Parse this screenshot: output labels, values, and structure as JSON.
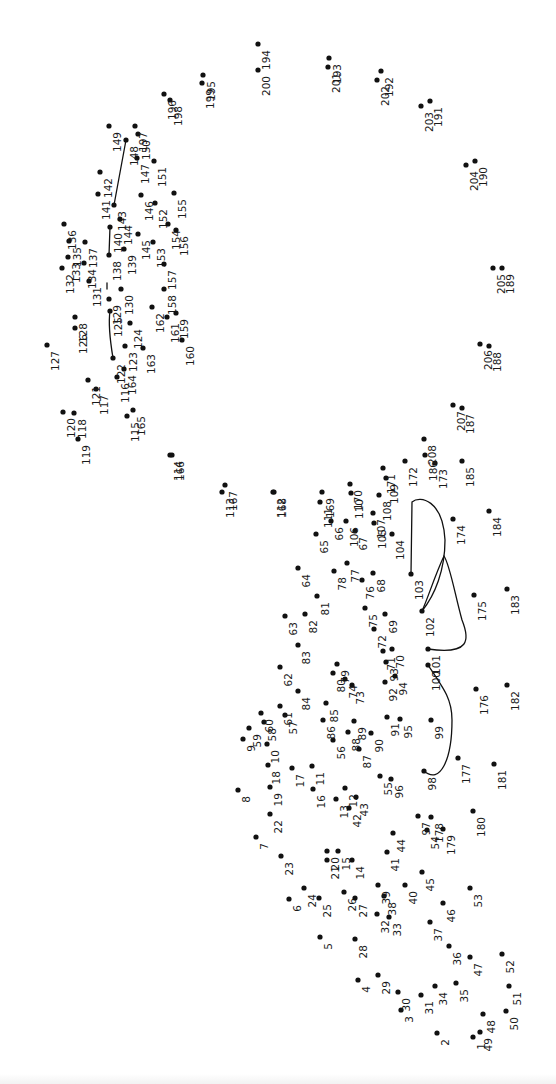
{
  "puzzle": {
    "title": "Connect the dots",
    "orientation": "rotated 90 degrees clockwise",
    "dot_count": 208,
    "ink_color": "#111111",
    "background_color": "#ffffff",
    "pre_drawn_connections": [
      [
        101,
        102
      ],
      [
        102,
        103
      ],
      [
        98,
        100
      ],
      [
        138,
        140
      ],
      [
        143,
        148
      ],
      [
        122,
        125
      ],
      [
        129,
        131
      ]
    ],
    "dots": [
      {
        "n": 1,
        "x": 473,
        "y": 1037
      },
      {
        "n": 2,
        "x": 437,
        "y": 1033
      },
      {
        "n": 3,
        "x": 401,
        "y": 1010
      },
      {
        "n": 4,
        "x": 358,
        "y": 980
      },
      {
        "n": 5,
        "x": 320,
        "y": 937
      },
      {
        "n": 6,
        "x": 289,
        "y": 899
      },
      {
        "n": 7,
        "x": 256,
        "y": 837
      },
      {
        "n": 8,
        "x": 238,
        "y": 790
      },
      {
        "n": 9,
        "x": 243,
        "y": 739
      },
      {
        "n": 10,
        "x": 267,
        "y": 744
      },
      {
        "n": 11,
        "x": 312,
        "y": 766
      },
      {
        "n": 12,
        "x": 345,
        "y": 788
      },
      {
        "n": 13,
        "x": 336,
        "y": 799
      },
      {
        "n": 14,
        "x": 352,
        "y": 860
      },
      {
        "n": 15,
        "x": 338,
        "y": 851
      },
      {
        "n": 16,
        "x": 313,
        "y": 789
      },
      {
        "n": 17,
        "x": 292,
        "y": 768
      },
      {
        "n": 18,
        "x": 268,
        "y": 765
      },
      {
        "n": 19,
        "x": 270,
        "y": 787
      },
      {
        "n": 20,
        "x": 327,
        "y": 851
      },
      {
        "n": 21,
        "x": 327,
        "y": 860
      },
      {
        "n": 22,
        "x": 270,
        "y": 814
      },
      {
        "n": 23,
        "x": 281,
        "y": 856
      },
      {
        "n": 24,
        "x": 304,
        "y": 888
      },
      {
        "n": 25,
        "x": 319,
        "y": 898
      },
      {
        "n": 26,
        "x": 344,
        "y": 892
      },
      {
        "n": 27,
        "x": 355,
        "y": 898
      },
      {
        "n": 28,
        "x": 355,
        "y": 939
      },
      {
        "n": 29,
        "x": 378,
        "y": 975
      },
      {
        "n": 30,
        "x": 398,
        "y": 992
      },
      {
        "n": 31,
        "x": 421,
        "y": 995
      },
      {
        "n": 32,
        "x": 377,
        "y": 914
      },
      {
        "n": 33,
        "x": 389,
        "y": 917
      },
      {
        "n": 34,
        "x": 435,
        "y": 986
      },
      {
        "n": 35,
        "x": 456,
        "y": 983
      },
      {
        "n": 36,
        "x": 449,
        "y": 946
      },
      {
        "n": 37,
        "x": 430,
        "y": 922
      },
      {
        "n": 38,
        "x": 384,
        "y": 896
      },
      {
        "n": 39,
        "x": 378,
        "y": 885
      },
      {
        "n": 40,
        "x": 405,
        "y": 885
      },
      {
        "n": 41,
        "x": 387,
        "y": 852
      },
      {
        "n": 42,
        "x": 349,
        "y": 808
      },
      {
        "n": 43,
        "x": 356,
        "y": 797
      },
      {
        "n": 44,
        "x": 393,
        "y": 833
      },
      {
        "n": 45,
        "x": 422,
        "y": 872
      },
      {
        "n": 46,
        "x": 443,
        "y": 903
      },
      {
        "n": 47,
        "x": 470,
        "y": 957
      },
      {
        "n": 48,
        "x": 483,
        "y": 1014
      },
      {
        "n": 49,
        "x": 480,
        "y": 1032
      },
      {
        "n": 50,
        "x": 506,
        "y": 1011
      },
      {
        "n": 51,
        "x": 509,
        "y": 986
      },
      {
        "n": 52,
        "x": 502,
        "y": 954
      },
      {
        "n": 53,
        "x": 470,
        "y": 888
      },
      {
        "n": 54,
        "x": 427,
        "y": 830
      },
      {
        "n": 55,
        "x": 380,
        "y": 776
      },
      {
        "n": 56,
        "x": 333,
        "y": 740
      },
      {
        "n": 57,
        "x": 285,
        "y": 715
      },
      {
        "n": 58,
        "x": 264,
        "y": 722
      },
      {
        "n": 59,
        "x": 249,
        "y": 728
      },
      {
        "n": 60,
        "x": 261,
        "y": 713
      },
      {
        "n": 61,
        "x": 280,
        "y": 706
      },
      {
        "n": 62,
        "x": 280,
        "y": 667
      },
      {
        "n": 63,
        "x": 285,
        "y": 616
      },
      {
        "n": 64,
        "x": 298,
        "y": 568
      },
      {
        "n": 65,
        "x": 316,
        "y": 534
      },
      {
        "n": 66,
        "x": 331,
        "y": 521
      },
      {
        "n": 67,
        "x": 355,
        "y": 531
      },
      {
        "n": 68,
        "x": 373,
        "y": 573
      },
      {
        "n": 69,
        "x": 385,
        "y": 614
      },
      {
        "n": 70,
        "x": 392,
        "y": 649
      },
      {
        "n": 71,
        "x": 383,
        "y": 651
      },
      {
        "n": 72,
        "x": 374,
        "y": 629
      },
      {
        "n": 73,
        "x": 352,
        "y": 685
      },
      {
        "n": 74,
        "x": 345,
        "y": 679
      },
      {
        "n": 75,
        "x": 365,
        "y": 608
      },
      {
        "n": 76,
        "x": 362,
        "y": 580
      },
      {
        "n": 77,
        "x": 347,
        "y": 563
      },
      {
        "n": 78,
        "x": 334,
        "y": 571
      },
      {
        "n": 79,
        "x": 337,
        "y": 664
      },
      {
        "n": 80,
        "x": 333,
        "y": 673
      },
      {
        "n": 81,
        "x": 317,
        "y": 596
      },
      {
        "n": 82,
        "x": 305,
        "y": 614
      },
      {
        "n": 83,
        "x": 298,
        "y": 645
      },
      {
        "n": 84,
        "x": 298,
        "y": 691
      },
      {
        "n": 85,
        "x": 326,
        "y": 703
      },
      {
        "n": 86,
        "x": 323,
        "y": 720
      },
      {
        "n": 87,
        "x": 359,
        "y": 749
      },
      {
        "n": 88,
        "x": 348,
        "y": 732
      },
      {
        "n": 89,
        "x": 354,
        "y": 721
      },
      {
        "n": 90,
        "x": 371,
        "y": 733
      },
      {
        "n": 91,
        "x": 387,
        "y": 717
      },
      {
        "n": 92,
        "x": 385,
        "y": 682
      },
      {
        "n": 93,
        "x": 386,
        "y": 662
      },
      {
        "n": 94,
        "x": 395,
        "y": 676
      },
      {
        "n": 95,
        "x": 400,
        "y": 719
      },
      {
        "n": 96,
        "x": 391,
        "y": 779
      },
      {
        "n": 97,
        "x": 418,
        "y": 816
      },
      {
        "n": 98,
        "x": 424,
        "y": 771
      },
      {
        "n": 99,
        "x": 431,
        "y": 720
      },
      {
        "n": 100,
        "x": 428,
        "y": 665
      },
      {
        "n": 101,
        "x": 428,
        "y": 649
      },
      {
        "n": 102,
        "x": 422,
        "y": 611
      },
      {
        "n": 103,
        "x": 411,
        "y": 574
      },
      {
        "n": 104,
        "x": 392,
        "y": 534
      },
      {
        "n": 105,
        "x": 374,
        "y": 523
      },
      {
        "n": 106,
        "x": 346,
        "y": 521
      },
      {
        "n": 107,
        "x": 373,
        "y": 513
      },
      {
        "n": 108,
        "x": 379,
        "y": 495
      },
      {
        "n": 109,
        "x": 386,
        "y": 478
      },
      {
        "n": 110,
        "x": 351,
        "y": 493
      },
      {
        "n": 111,
        "x": 320,
        "y": 502
      },
      {
        "n": 112,
        "x": 273,
        "y": 492
      },
      {
        "n": 113,
        "x": 222,
        "y": 492
      },
      {
        "n": 114,
        "x": 170,
        "y": 455
      },
      {
        "n": 115,
        "x": 127,
        "y": 416
      },
      {
        "n": 116,
        "x": 117,
        "y": 377
      },
      {
        "n": 117,
        "x": 96,
        "y": 389
      },
      {
        "n": 118,
        "x": 74,
        "y": 413
      },
      {
        "n": 119,
        "x": 78,
        "y": 439
      },
      {
        "n": 120,
        "x": 63,
        "y": 412
      },
      {
        "n": 121,
        "x": 88,
        "y": 380
      },
      {
        "n": 122,
        "x": 113,
        "y": 358
      },
      {
        "n": 123,
        "x": 125,
        "y": 346
      },
      {
        "n": 124,
        "x": 130,
        "y": 323
      },
      {
        "n": 125,
        "x": 110,
        "y": 311
      },
      {
        "n": 126,
        "x": 75,
        "y": 328
      },
      {
        "n": 127,
        "x": 47,
        "y": 345
      },
      {
        "n": 128,
        "x": 75,
        "y": 317
      },
      {
        "n": 129,
        "x": 109,
        "y": 299
      },
      {
        "n": 130,
        "x": 121,
        "y": 289
      },
      {
        "n": 131,
        "x": 89,
        "y": 281
      },
      {
        "n": 132,
        "x": 62,
        "y": 268
      },
      {
        "n": 133,
        "x": 68,
        "y": 257
      },
      {
        "n": 134,
        "x": 84,
        "y": 263
      },
      {
        "n": 135,
        "x": 69,
        "y": 241
      },
      {
        "n": 136,
        "x": 64,
        "y": 224
      },
      {
        "n": 137,
        "x": 85,
        "y": 242
      },
      {
        "n": 138,
        "x": 109,
        "y": 255
      },
      {
        "n": 139,
        "x": 124,
        "y": 249
      },
      {
        "n": 140,
        "x": 110,
        "y": 227
      },
      {
        "n": 141,
        "x": 98,
        "y": 194
      },
      {
        "n": 142,
        "x": 100,
        "y": 172
      },
      {
        "n": 143,
        "x": 114,
        "y": 205
      },
      {
        "n": 144,
        "x": 120,
        "y": 219
      },
      {
        "n": 145,
        "x": 138,
        "y": 234
      },
      {
        "n": 146,
        "x": 141,
        "y": 195
      },
      {
        "n": 147,
        "x": 137,
        "y": 158
      },
      {
        "n": 148,
        "x": 126,
        "y": 140
      },
      {
        "n": 149,
        "x": 109,
        "y": 126
      },
      {
        "n": 150,
        "x": 138,
        "y": 134
      },
      {
        "n": 151,
        "x": 154,
        "y": 161
      },
      {
        "n": 152,
        "x": 155,
        "y": 203
      },
      {
        "n": 153,
        "x": 153,
        "y": 242
      },
      {
        "n": 154,
        "x": 168,
        "y": 224
      },
      {
        "n": 155,
        "x": 174,
        "y": 193
      },
      {
        "n": 156,
        "x": 176,
        "y": 230
      },
      {
        "n": 157,
        "x": 164,
        "y": 264
      },
      {
        "n": 158,
        "x": 164,
        "y": 289
      },
      {
        "n": 159,
        "x": 176,
        "y": 313
      },
      {
        "n": 160,
        "x": 182,
        "y": 340
      },
      {
        "n": 161,
        "x": 167,
        "y": 317
      },
      {
        "n": 162,
        "x": 152,
        "y": 307
      },
      {
        "n": 163,
        "x": 143,
        "y": 348
      },
      {
        "n": 164,
        "x": 124,
        "y": 369
      },
      {
        "n": 165,
        "x": 133,
        "y": 410
      },
      {
        "n": 166,
        "x": 172,
        "y": 455
      },
      {
        "n": 167,
        "x": 225,
        "y": 485
      },
      {
        "n": 168,
        "x": 274,
        "y": 492
      },
      {
        "n": 169,
        "x": 322,
        "y": 492
      },
      {
        "n": 170,
        "x": 350,
        "y": 484
      },
      {
        "n": 171,
        "x": 383,
        "y": 468
      },
      {
        "n": 172,
        "x": 405,
        "y": 461
      },
      {
        "n": 173,
        "x": 435,
        "y": 463
      },
      {
        "n": 174,
        "x": 453,
        "y": 519
      },
      {
        "n": 175,
        "x": 474,
        "y": 595
      },
      {
        "n": 176,
        "x": 476,
        "y": 689
      },
      {
        "n": 177,
        "x": 458,
        "y": 758
      },
      {
        "n": 178,
        "x": 431,
        "y": 817
      },
      {
        "n": 179,
        "x": 443,
        "y": 829
      },
      {
        "n": 180,
        "x": 473,
        "y": 811
      },
      {
        "n": 181,
        "x": 494,
        "y": 764
      },
      {
        "n": 182,
        "x": 507,
        "y": 685
      },
      {
        "n": 183,
        "x": 507,
        "y": 589
      },
      {
        "n": 184,
        "x": 489,
        "y": 511
      },
      {
        "n": 185,
        "x": 462,
        "y": 461
      },
      {
        "n": 186,
        "x": 425,
        "y": 455
      },
      {
        "n": 187,
        "x": 462,
        "y": 408
      },
      {
        "n": 188,
        "x": 489,
        "y": 346
      },
      {
        "n": 189,
        "x": 502,
        "y": 268
      },
      {
        "n": 190,
        "x": 475,
        "y": 161
      },
      {
        "n": 191,
        "x": 430,
        "y": 101
      },
      {
        "n": 192,
        "x": 381,
        "y": 71
      },
      {
        "n": 193,
        "x": 329,
        "y": 58
      },
      {
        "n": 194,
        "x": 258,
        "y": 44
      },
      {
        "n": 195,
        "x": 203,
        "y": 75
      },
      {
        "n": 196,
        "x": 164,
        "y": 94
      },
      {
        "n": 197,
        "x": 135,
        "y": 126
      },
      {
        "n": 198,
        "x": 170,
        "y": 100
      },
      {
        "n": 199,
        "x": 202,
        "y": 83
      },
      {
        "n": 200,
        "x": 258,
        "y": 70
      },
      {
        "n": 201,
        "x": 328,
        "y": 67
      },
      {
        "n": 202,
        "x": 377,
        "y": 80
      },
      {
        "n": 203,
        "x": 421,
        "y": 106
      },
      {
        "n": 204,
        "x": 466,
        "y": 165
      },
      {
        "n": 205,
        "x": 493,
        "y": 268
      },
      {
        "n": 206,
        "x": 480,
        "y": 344
      },
      {
        "n": 207,
        "x": 453,
        "y": 405
      },
      {
        "n": 208,
        "x": 424,
        "y": 439
      }
    ]
  }
}
